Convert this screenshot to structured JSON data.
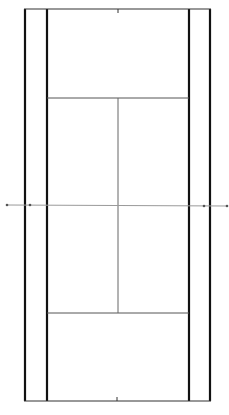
{
  "diagram": {
    "colors": {
      "background": "#ffffff",
      "line": "#111111",
      "net": "#9a9a9a",
      "inner_line": "#555555"
    },
    "court": {
      "outer_left_x": 25,
      "inner_left_x": 47,
      "inner_right_x": 189,
      "outer_right_x": 210,
      "top_baseline_y": 9,
      "bottom_baseline_y": 401,
      "top_service_y": 98,
      "bottom_service_y": 313,
      "center_x": 118,
      "net_y": 205,
      "net_x1": 7,
      "net_x2": 228,
      "posts_x": [
        7,
        30,
        204,
        227
      ]
    }
  }
}
